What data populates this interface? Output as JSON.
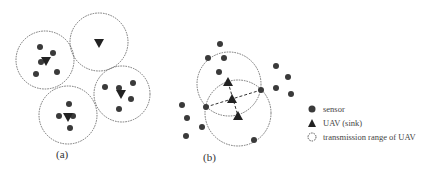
{
  "colors": {
    "sensor": "#3a3a3a",
    "uav": "#222222",
    "range": "#555555",
    "background": "#ffffff"
  },
  "panels": [
    {
      "label": "(a)",
      "label_pos": [
        62,
        156
      ],
      "circles": [
        {
          "cx": 45,
          "cy": 60,
          "r": 29
        },
        {
          "cx": 99,
          "cy": 42,
          "r": 29
        },
        {
          "cx": 122,
          "cy": 94,
          "r": 28
        },
        {
          "cx": 68,
          "cy": 115,
          "r": 29
        }
      ],
      "uavs": [
        {
          "x": 46,
          "y": 61,
          "dir": "down"
        },
        {
          "x": 99,
          "y": 43,
          "dir": "down"
        },
        {
          "x": 121,
          "y": 94,
          "dir": "down"
        },
        {
          "x": 68,
          "y": 117,
          "dir": "down"
        }
      ],
      "sensors": [
        [
          40,
          47
        ],
        [
          53,
          53
        ],
        [
          41,
          62
        ],
        [
          36,
          74
        ],
        [
          57,
          72
        ],
        [
          105,
          87
        ],
        [
          119,
          88
        ],
        [
          133,
          83
        ],
        [
          131,
          99
        ],
        [
          119,
          109
        ],
        [
          69,
          104
        ],
        [
          59,
          116
        ],
        [
          73,
          116
        ],
        [
          70,
          128
        ]
      ],
      "links": []
    },
    {
      "label": "(b)",
      "label_pos": [
        210,
        159
      ],
      "circles": [
        {
          "cx": 229,
          "cy": 84,
          "r": 32
        },
        {
          "cx": 238,
          "cy": 113,
          "r": 33
        }
      ],
      "uavs": [
        {
          "x": 228,
          "y": 82,
          "dir": "up"
        },
        {
          "x": 232,
          "y": 99,
          "dir": "up"
        },
        {
          "x": 238,
          "y": 116,
          "dir": "up"
        }
      ],
      "sensors": [
        [
          220,
          44
        ],
        [
          208,
          58
        ],
        [
          224,
          58
        ],
        [
          219,
          72
        ],
        [
          276,
          66
        ],
        [
          288,
          77
        ],
        [
          276,
          88
        ],
        [
          291,
          94
        ],
        [
          261,
          90
        ],
        [
          206,
          107
        ],
        [
          182,
          105
        ],
        [
          187,
          118
        ],
        [
          202,
          127
        ],
        [
          186,
          136
        ],
        [
          254,
          140
        ]
      ],
      "links": [
        {
          "x1": 206,
          "y1": 107,
          "x2": 261,
          "y2": 90
        },
        {
          "x1": 228,
          "y1": 82,
          "x2": 238,
          "y2": 116
        }
      ]
    }
  ],
  "legend": {
    "items": [
      {
        "icon": "sensor-dot-icon",
        "label": "sensor",
        "y": 104
      },
      {
        "icon": "uav-triangle-icon",
        "label": "UAV (sink)",
        "y": 118
      },
      {
        "icon": "range-circle-icon",
        "label": "transmission range of UAV",
        "y": 132
      }
    ]
  }
}
